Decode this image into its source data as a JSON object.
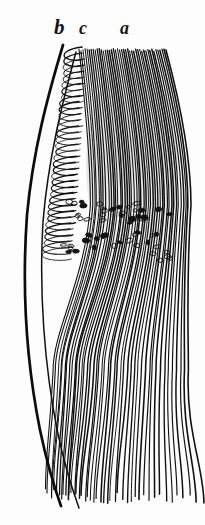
{
  "figure": {
    "kind": "anatomical-engraving",
    "subject": "Longitudinal section of muscle fibres with nuclei band",
    "background_color": "#fdfdfd",
    "ink_color": "#101010",
    "width": 205,
    "height": 525
  },
  "labels": [
    {
      "id": "b",
      "text": "b",
      "x": 54,
      "y": 17,
      "font_size": 21,
      "refers_to": "outer-boundary-line"
    },
    {
      "id": "c",
      "text": "c",
      "x": 79,
      "y": 19,
      "font_size": 18,
      "refers_to": "short-hooked-fibre-zone"
    },
    {
      "id": "a",
      "text": "a",
      "x": 120,
      "y": 19,
      "font_size": 18,
      "refers_to": "long-fibre-bundle"
    }
  ],
  "drawing": {
    "boundary_line": {
      "name": "thick-outer-curve",
      "stroke_width": 2.7,
      "path": "M 63 45 C 48 95, 33 150, 27 215 C 22 285, 26 360, 40 430 C 48 468, 56 492, 61 506"
    },
    "inner_boundary_line": {
      "name": "thin-inner-curve",
      "stroke_width": 1.5,
      "path": "M 76 52 C 62 104, 48 160, 43 222 C 39 290, 44 366, 58 434 C 66 472, 74 494, 79 508"
    },
    "fibre_bundle": {
      "name": "long-curved-fibres",
      "count": 44,
      "stroke_width": 1.15,
      "top_left": {
        "x": 79,
        "y": 49
      },
      "top_right": {
        "x": 166,
        "y": 44
      },
      "bulge_x_max": 186,
      "bottom_y": 506,
      "description": "Parallel fibres arching from a narrow upper origin, bulging right at mid height, sweeping down and splaying at the base."
    },
    "hook_zone": {
      "name": "short-hooked-fibres",
      "count": 34,
      "stroke_width": 1.0,
      "x_start": 62,
      "x_end": 96,
      "y_start": 50,
      "y_end": 250,
      "description": "Short recurved hook-shaped fibres crowded along the inner edge beneath label c."
    },
    "nuclei_band": {
      "name": "oval-nuclei-cluster",
      "count": 58,
      "y_range": [
        195,
        265
      ],
      "x_range": [
        62,
        170
      ],
      "cell_width": 5.5,
      "cell_height": 3.4,
      "description": "Band of small dark oval nuclei scattered transversely across the fibre bundle."
    },
    "shading": {
      "name": "mid-grey-wash",
      "region": {
        "x": 90,
        "y": 70,
        "width": 80,
        "height": 200
      },
      "opacity": 0.1
    }
  }
}
